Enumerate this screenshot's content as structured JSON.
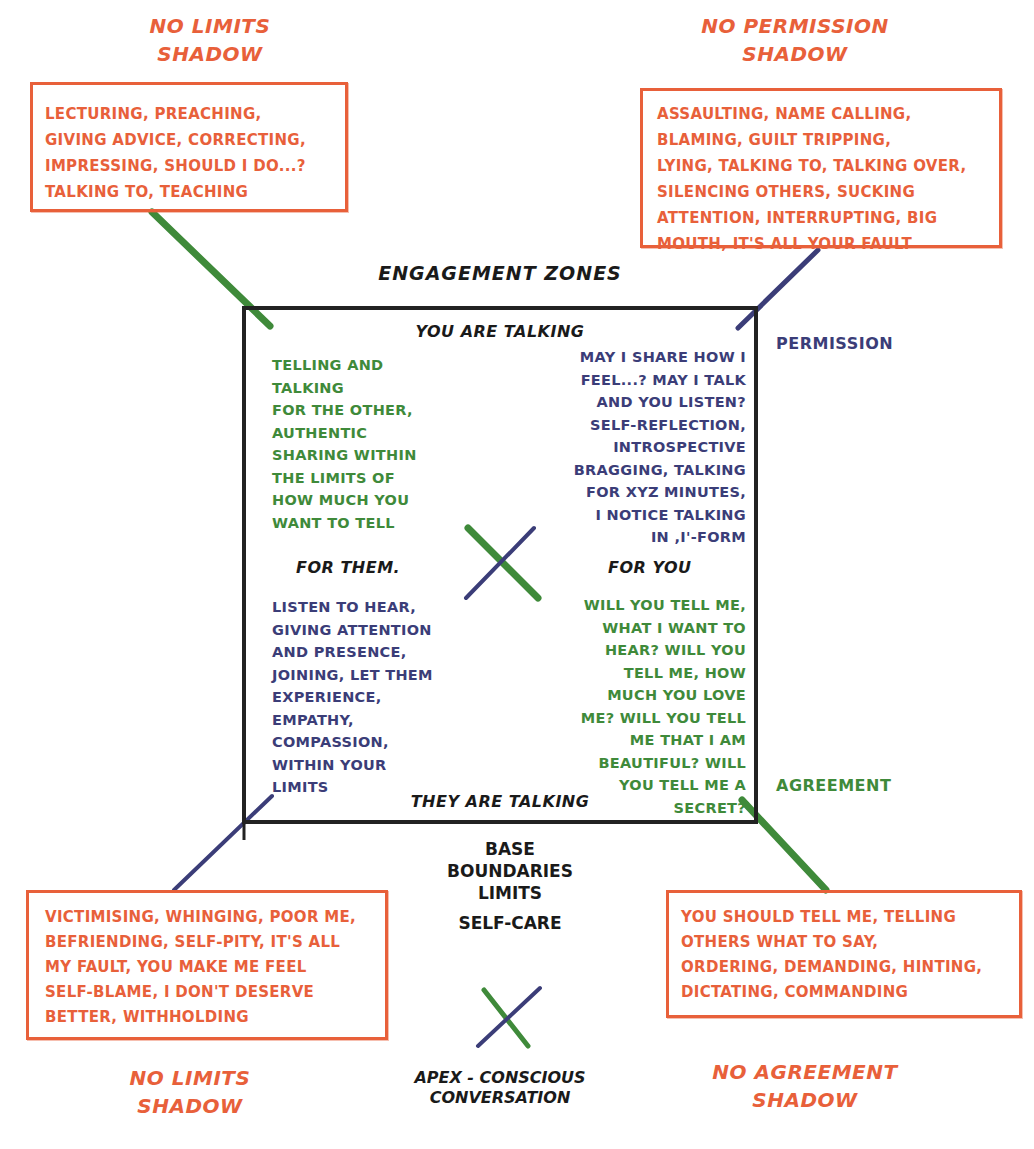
{
  "title": "ENGAGEMENT ZONES",
  "shadows": {
    "top_left": {
      "title_line1": "NO LIMITS",
      "title_line2": "SHADOW",
      "lines": [
        "LECTURING, PREACHING,",
        "GIVING ADVICE, CORRECTING,",
        "IMPRESSING, SHOULD I DO...?",
        "TALKING TO, TEACHING"
      ]
    },
    "top_right": {
      "title_line1": "NO PERMISSION",
      "title_line2": "SHADOW",
      "lines": [
        "ASSAULTING, NAME CALLING,",
        "BLAMING, GUILT TRIPPING,",
        "LYING, TALKING TO, TALKING OVER,",
        "SILENCING OTHERS, SUCKING",
        "ATTENTION, INTERRUPTING, BIG",
        "MOUTH, IT'S ALL YOUR FAULT"
      ]
    },
    "bottom_left": {
      "title_line1": "NO LIMITS",
      "title_line2": "SHADOW",
      "lines": [
        "VICTIMISING, WHINGING, POOR ME,",
        "BEFRIENDING, SELF-PITY, IT'S ALL",
        "MY FAULT, YOU MAKE ME FEEL",
        "SELF-BLAME, I DON'T DESERVE",
        "BETTER, WITHHOLDING"
      ]
    },
    "bottom_right": {
      "title_line1": "NO AGREEMENT",
      "title_line2": "SHADOW",
      "lines": [
        "YOU SHOULD TELL ME, TELLING",
        "OTHERS WHAT TO SAY,",
        "ORDERING, DEMANDING, HINTING,",
        "DICTATING, COMMANDING"
      ]
    }
  },
  "zone": {
    "top_label": "YOU ARE TALKING",
    "bottom_label": "THEY ARE TALKING",
    "left_label": "FOR THEM.",
    "right_label": "FOR YOU",
    "q_top_left": [
      "TELLING AND",
      "TALKING",
      "FOR THE OTHER,",
      "AUTHENTIC",
      "SHARING WITHIN",
      "THE LIMITS OF",
      "HOW MUCH YOU",
      "WANT TO TELL"
    ],
    "q_top_right": [
      "MAY I SHARE HOW I",
      "FEEL...? MAY I TALK",
      "AND YOU LISTEN?",
      "SELF-REFLECTION,",
      "INTROSPECTIVE",
      "BRAGGING, TALKING",
      "FOR XYZ MINUTES,",
      "I NOTICE TALKING",
      "IN ,I'-FORM"
    ],
    "q_bottom_left": [
      "LISTEN TO HEAR,",
      "GIVING ATTENTION",
      "AND PRESENCE,",
      "JOINING, LET THEM",
      "EXPERIENCE,",
      "EMPATHY,",
      "COMPASSION,",
      "WITHIN YOUR",
      "LIMITS"
    ],
    "q_bottom_right": [
      "WILL YOU TELL ME,",
      "WHAT I WANT TO",
      "HEAR? WILL YOU",
      "TELL ME, HOW",
      "MUCH YOU LOVE",
      "ME? WILL YOU TELL",
      "ME THAT I AM",
      "BEAUTIFUL? WILL",
      "YOU TELL ME A",
      "SECRET?"
    ]
  },
  "side_labels": {
    "permission": "PERMISSION",
    "agreement": "AGREEMENT"
  },
  "base": {
    "lines": [
      "BASE",
      "BOUNDARIES",
      "LIMITS"
    ],
    "self_care": "SELF-CARE"
  },
  "apex": {
    "line1": "APEX - CONSCIOUS",
    "line2": "CONVERSATION"
  },
  "colors": {
    "orange": "#e8603a",
    "green": "#3f8a3a",
    "navy": "#3b3d78",
    "black": "#1a1a1a"
  }
}
